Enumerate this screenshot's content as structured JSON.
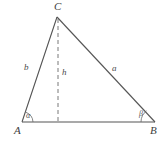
{
  "figure": {
    "type": "geometry-diagram",
    "shape": "triangle",
    "background_color": "#ffffff",
    "stroke_color": "#555555",
    "dashed_stroke_color": "#6a6a6a",
    "label_color": "#3a3a3a"
  },
  "vertices": {
    "A": {
      "label": "A",
      "x": 22,
      "y": 122
    },
    "B": {
      "label": "B",
      "x": 155,
      "y": 122
    },
    "C": {
      "label": "C",
      "x": 57,
      "y": 17
    }
  },
  "sides": {
    "left": {
      "label": "b",
      "from": "A",
      "to": "C"
    },
    "right": {
      "label": "a",
      "from": "C",
      "to": "B"
    },
    "base": {
      "label": "",
      "from": "A",
      "to": "B"
    }
  },
  "altitude": {
    "label": "h",
    "style": "dashed",
    "from": "C",
    "foot_x": 58,
    "foot_y": 122
  },
  "angles": {
    "at_A": {
      "label": "α",
      "vertex": "A"
    },
    "at_B": {
      "label": "β",
      "vertex": "B"
    }
  }
}
